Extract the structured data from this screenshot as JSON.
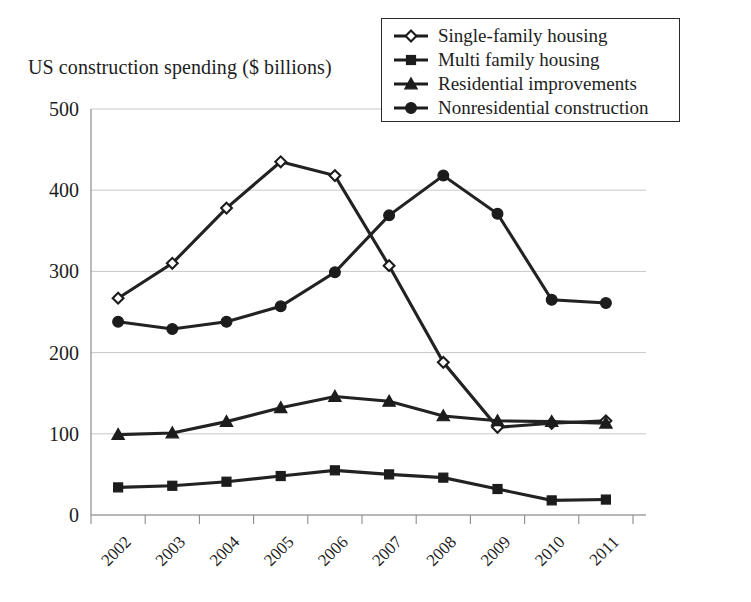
{
  "chart_data": {
    "type": "line",
    "title": "US construction spending ($ billions)",
    "xlabel": "",
    "ylabel": "",
    "ylim": [
      0,
      500
    ],
    "yticks": [
      0,
      100,
      200,
      300,
      400,
      500
    ],
    "grid": true,
    "legend_position": "top-right",
    "categories": [
      "2002",
      "2003",
      "2004",
      "2005",
      "2006",
      "2007",
      "2008",
      "2009",
      "2010",
      "2011"
    ],
    "series": [
      {
        "name": "Single-family housing",
        "marker": "open-diamond",
        "color": "#1c1c1c",
        "values": [
          267,
          310,
          378,
          435,
          418,
          307,
          188,
          108,
          113,
          116
        ]
      },
      {
        "name": "Multi family housing",
        "marker": "filled-square",
        "color": "#1c1c1c",
        "values": [
          34,
          36,
          41,
          48,
          55,
          50,
          46,
          32,
          18,
          19
        ]
      },
      {
        "name": "Residential improvements",
        "marker": "filled-triangle",
        "color": "#1c1c1c",
        "values": [
          99,
          101,
          115,
          132,
          146,
          140,
          122,
          116,
          115,
          113
        ]
      },
      {
        "name": "Nonresidential construction",
        "marker": "filled-circle",
        "color": "#1c1c1c",
        "values": [
          238,
          229,
          238,
          257,
          299,
          369,
          418,
          371,
          265,
          261
        ]
      }
    ]
  },
  "legend": {
    "items": [
      {
        "label": "Single-family housing",
        "marker": "open-diamond"
      },
      {
        "label": "Multi family housing",
        "marker": "filled-square"
      },
      {
        "label": "Residential improvements",
        "marker": "filled-triangle"
      },
      {
        "label": "Nonresidential construction",
        "marker": "filled-circle"
      }
    ]
  },
  "axes": {
    "y_tick_labels": [
      "500",
      "400",
      "300",
      "200",
      "100",
      "0"
    ],
    "x_tick_labels": [
      "2002",
      "2003",
      "2004",
      "2005",
      "2006",
      "2007",
      "2008",
      "2009",
      "2010",
      "2011"
    ]
  }
}
